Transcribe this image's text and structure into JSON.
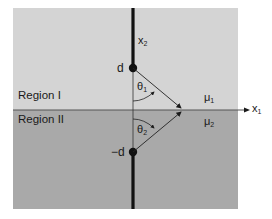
{
  "figure": {
    "regions": [
      {
        "label": "Region I",
        "permeability": "μ",
        "permeability_sub": "1",
        "color": "#d4d4d4"
      },
      {
        "label": "Region II",
        "permeability": "μ",
        "permeability_sub": "2",
        "color": "#a9a9a9"
      }
    ],
    "axes": {
      "x1": {
        "label": "x",
        "sub": "1"
      },
      "x2": {
        "label": "x",
        "sub": "2"
      }
    },
    "points": {
      "source": {
        "label": "d"
      },
      "image": {
        "label": "−d"
      }
    },
    "angles": {
      "theta1": {
        "label": "θ",
        "sub": "1"
      },
      "theta2": {
        "label": "θ",
        "sub": "2"
      }
    }
  }
}
